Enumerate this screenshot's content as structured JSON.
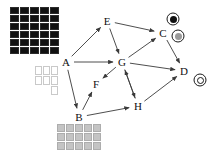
{
  "diagram": {
    "canvas": {
      "width": 216,
      "height": 157,
      "background": "#ffffff"
    },
    "edge_color": "#3a3a3a",
    "nodes": [
      {
        "id": "A",
        "label": "A",
        "x": 66,
        "y": 62
      },
      {
        "id": "B",
        "label": "B",
        "x": 79,
        "y": 117
      },
      {
        "id": "C",
        "label": "C",
        "x": 163,
        "y": 33
      },
      {
        "id": "D",
        "label": "D",
        "x": 184,
        "y": 71
      },
      {
        "id": "E",
        "label": "E",
        "x": 107,
        "y": 21
      },
      {
        "id": "F",
        "label": "F",
        "x": 96,
        "y": 84
      },
      {
        "id": "G",
        "label": "G",
        "x": 122,
        "y": 62
      },
      {
        "id": "H",
        "label": "H",
        "x": 138,
        "y": 106
      }
    ],
    "edges": [
      {
        "from": "A",
        "to": "E"
      },
      {
        "from": "A",
        "to": "G"
      },
      {
        "from": "A",
        "to": "B"
      },
      {
        "from": "E",
        "to": "G"
      },
      {
        "from": "E",
        "to": "C"
      },
      {
        "from": "G",
        "to": "C"
      },
      {
        "from": "G",
        "to": "D"
      },
      {
        "from": "G",
        "to": "F"
      },
      {
        "from": "G",
        "to": "H"
      },
      {
        "from": "B",
        "to": "F"
      },
      {
        "from": "B",
        "to": "H"
      },
      {
        "from": "H",
        "to": "G"
      },
      {
        "from": "H",
        "to": "D"
      },
      {
        "from": "C",
        "to": "D"
      }
    ],
    "swatch_groups": [
      {
        "name": "dark-token-grid",
        "x": 10,
        "y": 7,
        "columns": 5,
        "rows": 6,
        "cell_width": 9,
        "cell_height": 7,
        "style": "dark",
        "color": "#111111",
        "count": 30
      },
      {
        "name": "light-token-grid",
        "x": 35,
        "y": 66,
        "columns": 3,
        "rows": 3,
        "cell_width": 7,
        "cell_height": 9,
        "style": "light",
        "color": "#ffffff",
        "count": 7,
        "pattern": [
          1,
          1,
          1,
          1,
          1,
          1,
          0,
          0,
          1
        ]
      },
      {
        "name": "gray-token-grid",
        "x": 57,
        "y": 124,
        "columns": 5,
        "rows": 3,
        "cell_width": 8,
        "cell_height": 8,
        "style": "gray",
        "color": "#c4c4c4",
        "count": 15
      }
    ],
    "ring_markers": [
      {
        "name": "marker-filled-black",
        "x": 173,
        "y": 19,
        "outer_diameter": 13,
        "core_diameter": 7,
        "core_style": "black",
        "core_color": "#101010",
        "attached_to": "C"
      },
      {
        "name": "marker-filled-gray",
        "x": 178,
        "y": 36,
        "outer_diameter": 13,
        "core_diameter": 7,
        "core_style": "gray",
        "core_color": "#9a9a9a",
        "attached_to": "C"
      },
      {
        "name": "marker-empty-ring",
        "x": 200,
        "y": 80,
        "outer_diameter": 13,
        "core_diameter": 7,
        "core_style": "none",
        "core_color": "transparent",
        "attached_to": "D"
      }
    ]
  }
}
